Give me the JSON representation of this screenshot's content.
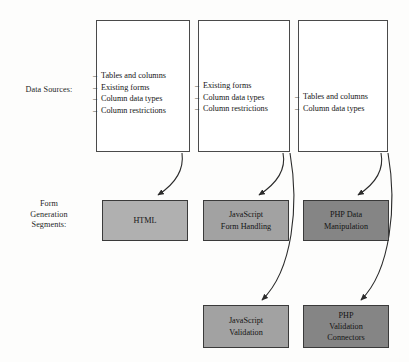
{
  "diagram": {
    "rows": {
      "data_sources_label": [
        "Data Sources:"
      ],
      "form_segments_label": [
        "Form",
        "Generation",
        "Segments:"
      ]
    },
    "source_boxes": [
      {
        "id": "source-box-0",
        "items": [
          "Tables and columns",
          "Existing forms",
          "Column data types",
          "Column restrictions"
        ]
      },
      {
        "id": "source-box-1",
        "items": [
          "Existing forms",
          "Column data types",
          "Column restrictions"
        ]
      },
      {
        "id": "source-box-2",
        "items": [
          "Tables and columns",
          "Column data types"
        ]
      }
    ],
    "bullet_marker": "–",
    "segment_boxes": [
      {
        "id": "segment-box-0",
        "lines": [
          "HTML"
        ],
        "fill": "#b0b0b0"
      },
      {
        "id": "segment-box-1",
        "lines": [
          "JavaScript",
          "Form Handling"
        ],
        "fill": "#a2a2a2"
      },
      {
        "id": "segment-box-2",
        "lines": [
          "PHP Data",
          "Manipulation"
        ],
        "fill": "#858585"
      },
      {
        "id": "segment-box-3",
        "lines": [
          "JavaScript",
          "Validation"
        ],
        "fill": "#a2a2a2"
      },
      {
        "id": "segment-box-4",
        "lines": [
          "PHP",
          "Validation",
          "Connectors"
        ],
        "fill": "#858585"
      }
    ],
    "colors": {
      "page_background": "#fdfdfc",
      "source_box_fill": "#ffffff",
      "source_box_border": "#4a4a4a",
      "segment_box_border": "#3a3a3a",
      "arrow_stroke": "#2b2b2b",
      "text": "#1a1a1a"
    },
    "arrows": [
      {
        "from": "source-box-0",
        "to": "segment-box-0"
      },
      {
        "from": "source-box-1",
        "to": "segment-box-1"
      },
      {
        "from": "source-box-1",
        "to": "segment-box-3"
      },
      {
        "from": "source-box-2",
        "to": "segment-box-2"
      },
      {
        "from": "source-box-2",
        "to": "segment-box-4"
      }
    ]
  }
}
